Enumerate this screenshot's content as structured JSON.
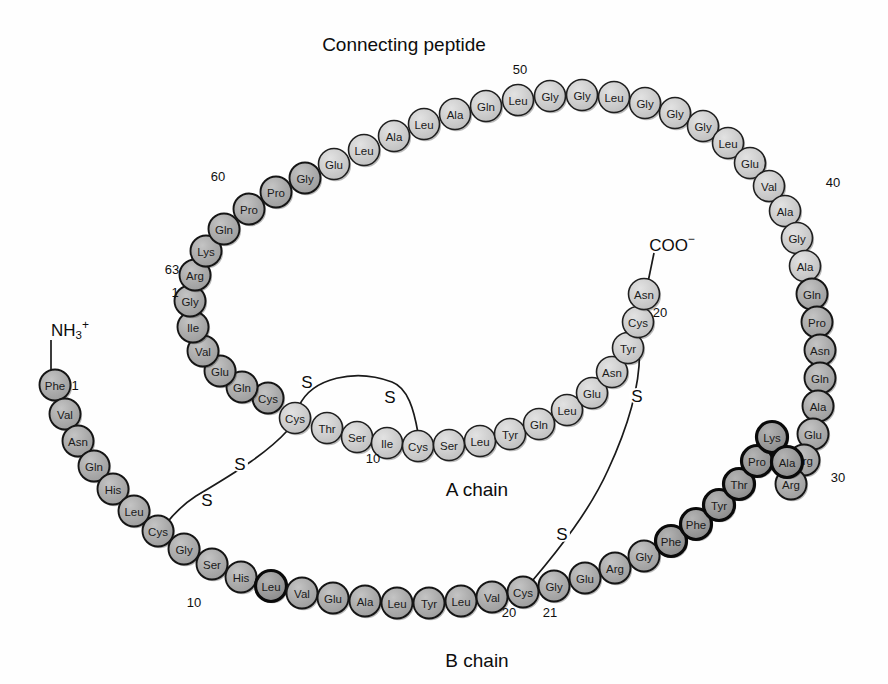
{
  "figure": {
    "title": "Connecting peptide",
    "a_chain_label": "A chain",
    "b_chain_label": "B chain",
    "n_terminus": "NH3+",
    "n_terminus_base": "NH",
    "n_terminus_sub": "3",
    "n_terminus_sup": "+",
    "c_terminus": "COO−",
    "c_terminus_base": "COO",
    "c_terminus_sup": "−",
    "sulfur_label": "S",
    "colors": {
      "circle_light": "#c9c9c9",
      "circle_dark": "#a8a8a8",
      "outline": "#1a1a1a",
      "text": "#1a1a1a",
      "background": "#ffffff"
    }
  },
  "numbers": [
    {
      "label": "50",
      "x": 520,
      "y": 69
    },
    {
      "label": "60",
      "x": 218,
      "y": 176
    },
    {
      "label": "63",
      "x": 172,
      "y": 269
    },
    {
      "label": "1",
      "x": 175,
      "y": 292
    },
    {
      "label": "40",
      "x": 833,
      "y": 182
    },
    {
      "label": "30",
      "x": 838,
      "y": 477
    },
    {
      "label": "20",
      "x": 660,
      "y": 312
    },
    {
      "label": "1",
      "x": 75,
      "y": 385
    },
    {
      "label": "10",
      "x": 373,
      "y": 458
    },
    {
      "label": "10",
      "x": 194,
      "y": 602
    },
    {
      "label": "20",
      "x": 509,
      "y": 612
    },
    {
      "label": "21",
      "x": 550,
      "y": 612
    }
  ],
  "sulfur_labels": [
    {
      "x": 307,
      "y": 382
    },
    {
      "x": 390,
      "y": 397
    },
    {
      "x": 240,
      "y": 464
    },
    {
      "x": 207,
      "y": 500
    },
    {
      "x": 637,
      "y": 396
    },
    {
      "x": 562,
      "y": 534
    }
  ],
  "connecting_peptide": {
    "name": "Connecting peptide",
    "residues": [
      {
        "aa": "Cys",
        "x": 268,
        "y": 398,
        "shade": "dark"
      },
      {
        "aa": "Gln",
        "x": 242,
        "y": 387,
        "shade": "dark"
      },
      {
        "aa": "Glu",
        "x": 220,
        "y": 371,
        "shade": "dark"
      },
      {
        "aa": "Val",
        "x": 203,
        "y": 351,
        "shade": "dark"
      },
      {
        "aa": "Ile",
        "x": 193,
        "y": 327,
        "shade": "dark"
      },
      {
        "aa": "Gly",
        "x": 190,
        "y": 301,
        "shade": "dark"
      },
      {
        "aa": "Arg",
        "x": 195,
        "y": 275,
        "shade": "dark"
      },
      {
        "aa": "Lys",
        "x": 206,
        "y": 251,
        "shade": "dark"
      },
      {
        "aa": "Gln",
        "x": 224,
        "y": 229,
        "shade": "dark"
      },
      {
        "aa": "Pro",
        "x": 249,
        "y": 209,
        "shade": "dark"
      },
      {
        "aa": "Pro",
        "x": 276,
        "y": 192,
        "shade": "dark"
      },
      {
        "aa": "Gly",
        "x": 305,
        "y": 178,
        "shade": "dark"
      },
      {
        "aa": "Glu",
        "x": 334,
        "y": 164,
        "shade": "light"
      },
      {
        "aa": "Leu",
        "x": 364,
        "y": 150,
        "shade": "light"
      },
      {
        "aa": "Ala",
        "x": 394,
        "y": 136,
        "shade": "light"
      },
      {
        "aa": "Leu",
        "x": 424,
        "y": 124,
        "shade": "light"
      },
      {
        "aa": "Ala",
        "x": 455,
        "y": 114,
        "shade": "light"
      },
      {
        "aa": "Gln",
        "x": 486,
        "y": 106,
        "shade": "light"
      },
      {
        "aa": "Leu",
        "x": 518,
        "y": 100,
        "shade": "light"
      },
      {
        "aa": "Gly",
        "x": 550,
        "y": 96,
        "shade": "light"
      },
      {
        "aa": "Gly",
        "x": 582,
        "y": 95,
        "shade": "light"
      },
      {
        "aa": "Leu",
        "x": 614,
        "y": 97,
        "shade": "light"
      },
      {
        "aa": "Gly",
        "x": 645,
        "y": 103,
        "shade": "light"
      },
      {
        "aa": "Gly",
        "x": 675,
        "y": 113,
        "shade": "light"
      },
      {
        "aa": "Gly",
        "x": 703,
        "y": 126,
        "shade": "light"
      },
      {
        "aa": "Leu",
        "x": 728,
        "y": 143,
        "shade": "light"
      },
      {
        "aa": "Glu",
        "x": 750,
        "y": 163,
        "shade": "light"
      },
      {
        "aa": "Val",
        "x": 769,
        "y": 186,
        "shade": "light"
      },
      {
        "aa": "Ala",
        "x": 785,
        "y": 211,
        "shade": "light"
      },
      {
        "aa": "Gly",
        "x": 797,
        "y": 238,
        "shade": "light"
      },
      {
        "aa": "Ala",
        "x": 805,
        "y": 266,
        "shade": "light"
      },
      {
        "aa": "Gln",
        "x": 812,
        "y": 294,
        "shade": "dark"
      },
      {
        "aa": "Pro",
        "x": 817,
        "y": 322,
        "shade": "dark"
      },
      {
        "aa": "Asn",
        "x": 820,
        "y": 350,
        "shade": "dark"
      },
      {
        "aa": "Gln",
        "x": 820,
        "y": 378,
        "shade": "dark"
      },
      {
        "aa": "Ala",
        "x": 818,
        "y": 406,
        "shade": "dark"
      },
      {
        "aa": "Glu",
        "x": 813,
        "y": 434,
        "shade": "dark"
      },
      {
        "aa": "Arg",
        "x": 804,
        "y": 460,
        "shade": "dark"
      },
      {
        "aa": "Arg",
        "x": 791,
        "y": 484,
        "shade": "dark"
      }
    ]
  },
  "a_chain": {
    "name": "A chain",
    "residues": [
      {
        "aa": "Cys",
        "x": 295,
        "y": 418,
        "shade": "light"
      },
      {
        "aa": "Thr",
        "x": 327,
        "y": 428,
        "shade": "light"
      },
      {
        "aa": "Ser",
        "x": 357,
        "y": 437,
        "shade": "light"
      },
      {
        "aa": "Ile",
        "x": 387,
        "y": 443,
        "shade": "light"
      },
      {
        "aa": "Cys",
        "x": 418,
        "y": 446,
        "shade": "light"
      },
      {
        "aa": "Ser",
        "x": 449,
        "y": 445,
        "shade": "light"
      },
      {
        "aa": "Leu",
        "x": 480,
        "y": 441,
        "shade": "light"
      },
      {
        "aa": "Tyr",
        "x": 510,
        "y": 434,
        "shade": "light"
      },
      {
        "aa": "Gln",
        "x": 539,
        "y": 424,
        "shade": "light"
      },
      {
        "aa": "Leu",
        "x": 567,
        "y": 410,
        "shade": "light"
      },
      {
        "aa": "Glu",
        "x": 592,
        "y": 393,
        "shade": "light"
      },
      {
        "aa": "Asn",
        "x": 612,
        "y": 372,
        "shade": "light"
      },
      {
        "aa": "Tyr",
        "x": 628,
        "y": 348,
        "shade": "light"
      },
      {
        "aa": "Cys",
        "x": 638,
        "y": 322,
        "shade": "light"
      },
      {
        "aa": "Asn",
        "x": 644,
        "y": 294,
        "shade": "light"
      }
    ]
  },
  "b_chain": {
    "name": "B chain",
    "residues": [
      {
        "aa": "Phe",
        "x": 55,
        "y": 385,
        "shade": "dark"
      },
      {
        "aa": "Val",
        "x": 65,
        "y": 414,
        "shade": "dark"
      },
      {
        "aa": "Asn",
        "x": 78,
        "y": 441,
        "shade": "dark"
      },
      {
        "aa": "Gln",
        "x": 94,
        "y": 466,
        "shade": "dark"
      },
      {
        "aa": "His",
        "x": 113,
        "y": 489,
        "shade": "dark"
      },
      {
        "aa": "Leu",
        "x": 134,
        "y": 511,
        "shade": "dark"
      },
      {
        "aa": "Cys",
        "x": 158,
        "y": 531,
        "shade": "dark"
      },
      {
        "aa": "Gly",
        "x": 184,
        "y": 549,
        "shade": "dark"
      },
      {
        "aa": "Ser",
        "x": 212,
        "y": 564,
        "shade": "dark"
      },
      {
        "aa": "His",
        "x": 241,
        "y": 577,
        "shade": "dark"
      },
      {
        "aa": "Leu",
        "x": 271,
        "y": 586,
        "shade": "darkest"
      },
      {
        "aa": "Val",
        "x": 302,
        "y": 593,
        "shade": "dark"
      },
      {
        "aa": "Glu",
        "x": 333,
        "y": 598,
        "shade": "dark"
      },
      {
        "aa": "Ala",
        "x": 365,
        "y": 601,
        "shade": "dark"
      },
      {
        "aa": "Leu",
        "x": 397,
        "y": 603,
        "shade": "dark"
      },
      {
        "aa": "Tyr",
        "x": 429,
        "y": 603,
        "shade": "dark"
      },
      {
        "aa": "Leu",
        "x": 461,
        "y": 601,
        "shade": "dark"
      },
      {
        "aa": "Val",
        "x": 492,
        "y": 597,
        "shade": "dark"
      },
      {
        "aa": "Cys",
        "x": 523,
        "y": 592,
        "shade": "dark"
      },
      {
        "aa": "Gly",
        "x": 554,
        "y": 586,
        "shade": "dark"
      },
      {
        "aa": "Glu",
        "x": 585,
        "y": 578,
        "shade": "dark"
      },
      {
        "aa": "Arg",
        "x": 615,
        "y": 568,
        "shade": "dark"
      },
      {
        "aa": "Gly",
        "x": 644,
        "y": 556,
        "shade": "dark"
      },
      {
        "aa": "Phe",
        "x": 671,
        "y": 541,
        "shade": "darkest"
      },
      {
        "aa": "Phe",
        "x": 696,
        "y": 524,
        "shade": "darkest"
      },
      {
        "aa": "Tyr",
        "x": 719,
        "y": 505,
        "shade": "darkest"
      },
      {
        "aa": "Thr",
        "x": 739,
        "y": 484,
        "shade": "darkest"
      },
      {
        "aa": "Pro",
        "x": 757,
        "y": 461,
        "shade": "darkest"
      },
      {
        "aa": "Lys",
        "x": 772,
        "y": 437,
        "shade": "darkest"
      },
      {
        "aa": "Ala",
        "x": 787,
        "y": 462,
        "shade": "darkest"
      }
    ]
  },
  "disulfide_bonds": [
    {
      "name": "intra-a-chain",
      "path": "M 299 406 C 312 378 355 368 392 382 C 408 388 414 410 418 433"
    },
    {
      "name": "a-b-interchain-1",
      "path": "M 288 430 C 268 452 240 470 196 496 C 182 505 172 516 165 525"
    },
    {
      "name": "a-b-interchain-2",
      "path": "M 638 334 C 644 372 632 418 608 470 C 590 510 560 548 533 580"
    }
  ],
  "terminal_stems": [
    {
      "name": "n-term-stem",
      "x1": 51,
      "y1": 372,
      "x2": 51,
      "y2": 340
    },
    {
      "name": "c-term-stem",
      "x1": 648,
      "y1": 282,
      "x2": 654,
      "y2": 253
    }
  ]
}
